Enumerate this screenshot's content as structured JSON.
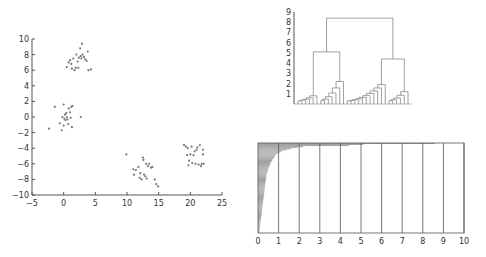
{
  "colors": {
    "axis": "#555555",
    "point": "#777777",
    "line": "#888888",
    "bar": "#999999"
  },
  "chart_data": [
    {
      "type": "scatter",
      "title": "",
      "xlabel": "",
      "ylabel": "",
      "xlim": [
        -5,
        25
      ],
      "ylim": [
        -10,
        10
      ],
      "xticks": [
        -5,
        0,
        5,
        10,
        15,
        20,
        25
      ],
      "yticks": [
        10,
        8,
        6,
        4,
        2,
        0,
        -2,
        -4,
        -6,
        -8,
        -10
      ],
      "grid": false,
      "series": [
        {
          "name": "cluster-1",
          "points": [
            [
              0.5,
              6.4
            ],
            [
              0.8,
              7
            ],
            [
              1,
              7.3
            ],
            [
              1.2,
              6.8
            ],
            [
              1.3,
              6.2
            ],
            [
              1.5,
              7.5
            ],
            [
              1.7,
              6
            ],
            [
              1.9,
              6.3
            ],
            [
              2,
              8
            ],
            [
              2.2,
              7.1
            ],
            [
              2.3,
              6.3
            ],
            [
              2.4,
              7.6
            ],
            [
              2.6,
              8.8
            ],
            [
              2.7,
              7.8
            ],
            [
              2.8,
              7.5
            ],
            [
              2.9,
              9.4
            ],
            [
              3,
              8
            ],
            [
              3.2,
              7.7
            ],
            [
              3.4,
              7.4
            ],
            [
              3.6,
              7.2
            ],
            [
              3.8,
              8.4
            ],
            [
              3.9,
              6
            ],
            [
              4.3,
              6.1
            ]
          ]
        },
        {
          "name": "cluster-2",
          "points": [
            [
              -2.3,
              -1.5
            ],
            [
              -1.4,
              1.3
            ],
            [
              -0.6,
              -0.8
            ],
            [
              -0.3,
              -1.7
            ],
            [
              -0.2,
              0
            ],
            [
              0,
              1.6
            ],
            [
              0,
              -1.1
            ],
            [
              0.1,
              -0.2
            ],
            [
              0.2,
              0.3
            ],
            [
              0.3,
              -0.4
            ],
            [
              0.4,
              0.5
            ],
            [
              0.5,
              0
            ],
            [
              0.6,
              -0.3
            ],
            [
              0.7,
              -0.9
            ],
            [
              0.8,
              1.1
            ],
            [
              1,
              0.6
            ],
            [
              1.1,
              -0.1
            ],
            [
              1.2,
              1.3
            ],
            [
              1.3,
              -1.3
            ],
            [
              1.4,
              1.4
            ],
            [
              2.7,
              0
            ]
          ]
        },
        {
          "name": "cluster-3",
          "points": [
            [
              9.9,
              -4.8
            ],
            [
              11,
              -6.7
            ],
            [
              11.1,
              -7.4
            ],
            [
              11.4,
              -6.8
            ],
            [
              11.8,
              -6.4
            ],
            [
              12,
              -7.8
            ],
            [
              12.1,
              -7.2
            ],
            [
              12.3,
              -8
            ],
            [
              12.5,
              -5.2
            ],
            [
              12.6,
              -5.5
            ],
            [
              12.7,
              -7.4
            ],
            [
              12.9,
              -7.6
            ],
            [
              13,
              -6
            ],
            [
              13.1,
              -7.9
            ],
            [
              13.3,
              -6.3
            ],
            [
              13.5,
              -6
            ],
            [
              13.8,
              -6.5
            ],
            [
              14,
              -6.4
            ],
            [
              14.4,
              -8
            ],
            [
              14.6,
              -8.6
            ],
            [
              14.9,
              -8.9
            ]
          ]
        },
        {
          "name": "cluster-4",
          "points": [
            [
              19,
              -3.6
            ],
            [
              19.3,
              -3.8
            ],
            [
              19.5,
              -4.9
            ],
            [
              19.6,
              -4
            ],
            [
              19.7,
              -6.2
            ],
            [
              19.8,
              -5.6
            ],
            [
              20,
              -4.8
            ],
            [
              20.2,
              -3.8
            ],
            [
              20.3,
              -5.9
            ],
            [
              20.5,
              -4.9
            ],
            [
              20.7,
              -4.4
            ],
            [
              20.8,
              -6
            ],
            [
              21,
              -4.2
            ],
            [
              21.1,
              -3.9
            ],
            [
              21.3,
              -6.1
            ],
            [
              21.5,
              -3.6
            ],
            [
              21.7,
              -6.3
            ],
            [
              21.8,
              -6
            ],
            [
              22,
              -4.2
            ],
            [
              22,
              -4.8
            ],
            [
              22.1,
              -6
            ]
          ]
        }
      ]
    },
    {
      "type": "dendrogram",
      "title": "",
      "ylim": [
        0,
        9
      ],
      "yticks": [
        1,
        2,
        3,
        4,
        5,
        6,
        7,
        8,
        9
      ],
      "top_merge_height": 8.4,
      "left_merge_height": 5.1,
      "right_merge_height": 4.4,
      "cluster_merge_heights": [
        0.8,
        2.2,
        1.9,
        1.2
      ]
    },
    {
      "type": "bar",
      "orientation": "horizontal",
      "title": "",
      "xlim": [
        0,
        10
      ],
      "xticks": [
        0,
        1,
        2,
        3,
        4,
        5,
        6,
        7,
        8,
        9,
        10
      ],
      "grid": true,
      "values": [
        8.6,
        5.1,
        4.4,
        2.2,
        1.9,
        1.6,
        1.4,
        1.2,
        1.1,
        1.0,
        0.9,
        0.85,
        0.8,
        0.8,
        0.75,
        0.7,
        0.7,
        0.65,
        0.6,
        0.6,
        0.6,
        0.55,
        0.55,
        0.5,
        0.5,
        0.5,
        0.45,
        0.45,
        0.45,
        0.4,
        0.4,
        0.4,
        0.4,
        0.4,
        0.38,
        0.38,
        0.36,
        0.36,
        0.35,
        0.35,
        0.34,
        0.33,
        0.33,
        0.32,
        0.32,
        0.31,
        0.3,
        0.3,
        0.3,
        0.28,
        0.28,
        0.27,
        0.26,
        0.26,
        0.25,
        0.25,
        0.24,
        0.23,
        0.22,
        0.22,
        0.21,
        0.2,
        0.2,
        0.2,
        0.19,
        0.18,
        0.18,
        0.17,
        0.16,
        0.15,
        0.15,
        0.14,
        0.13,
        0.12,
        0.12,
        0.11,
        0.1,
        0.1,
        0.1,
        0.09,
        0.08,
        0.08,
        0.07,
        0.06,
        0.05
      ]
    }
  ]
}
